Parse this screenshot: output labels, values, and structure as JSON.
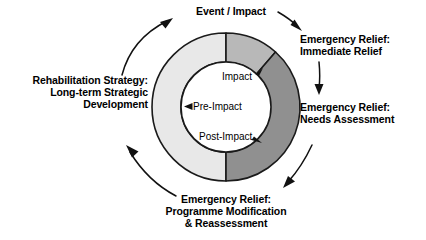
{
  "diagram": {
    "type": "cyclical-donut-process",
    "colors": {
      "segment_light": "#e8e8e8",
      "segment_medium": "#b8b8b8",
      "segment_dark": "#909090",
      "stroke": "#1a1a1a",
      "background": "#ffffff",
      "text": "#000000"
    },
    "outer_labels": {
      "top": "Event / Impact",
      "right_upper": "Emergency Relief:\nImmediate Relief",
      "right_lower": "Emergency Relief:\nNeeds Assessment",
      "bottom": "Emergency Relief:\nProgramme Modification\n& Reassessment",
      "left": "Rehabilitation Strategy:\nLong-term Strategic\nDevelopment"
    },
    "inner_labels": {
      "impact": "Impact",
      "pre_impact": "Pre-Impact",
      "post_impact": "Post-Impact"
    },
    "ring": {
      "center_x": 226,
      "center_y": 107,
      "outer_radius": 74,
      "inner_radius": 45,
      "segments": [
        {
          "name": "impact-segment",
          "start_deg": 0,
          "end_deg": 42,
          "fill": "#b8b8b8",
          "phase": "Impact"
        },
        {
          "name": "post-impact-segment",
          "start_deg": 42,
          "end_deg": 180,
          "fill": "#909090",
          "phase": "Post-Impact"
        },
        {
          "name": "pre-impact-segment",
          "start_deg": 180,
          "end_deg": 360,
          "fill": "#e8e8e8",
          "phase": "Pre-Impact"
        }
      ]
    },
    "arrows": [
      {
        "name": "arrow-to-event-impact",
        "from": "Rehabilitation Strategy",
        "to": "Event / Impact"
      },
      {
        "name": "arrow-to-immediate-relief",
        "from": "Event / Impact",
        "to": "Emergency Relief: Immediate Relief"
      },
      {
        "name": "arrow-to-needs-assessment",
        "from": "Emergency Relief: Immediate Relief",
        "to": "Emergency Relief: Needs Assessment"
      },
      {
        "name": "arrow-to-programme-modification",
        "from": "Emergency Relief: Needs Assessment",
        "to": "Emergency Relief: Programme Modification & Reassessment"
      },
      {
        "name": "arrow-to-rehabilitation",
        "from": "Emergency Relief: Programme Modification & Reassessment",
        "to": "Rehabilitation Strategy"
      }
    ]
  }
}
